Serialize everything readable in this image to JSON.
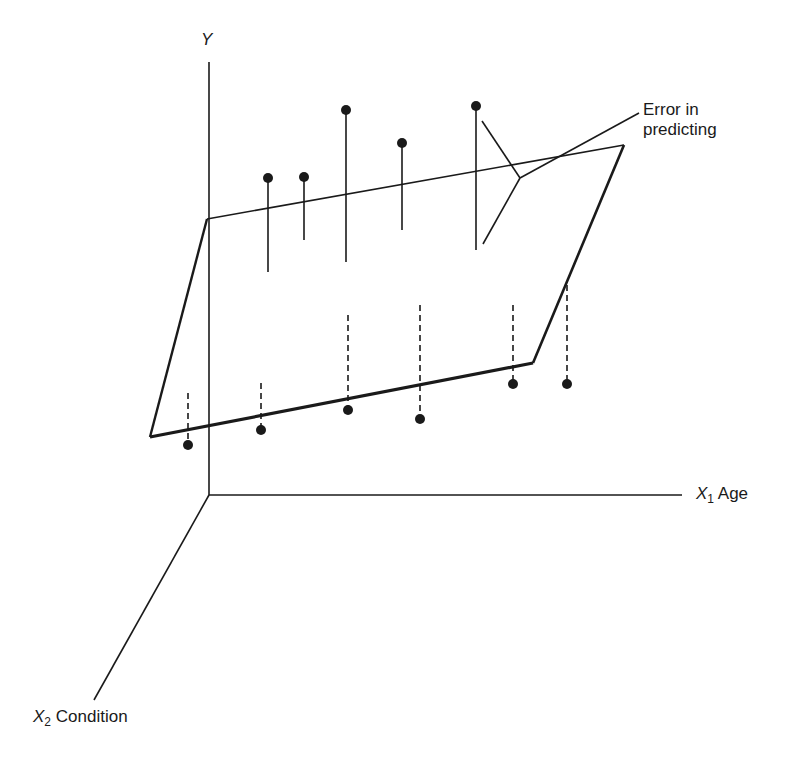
{
  "diagram": {
    "type": "3d-regression-plane",
    "axes": {
      "y": {
        "symbol": "Y"
      },
      "x1": {
        "symbol": "X",
        "subscript": "1",
        "name": "Age"
      },
      "x2": {
        "symbol": "X",
        "subscript": "2",
        "name": "Condition"
      }
    },
    "annotation": {
      "line1": "Error in",
      "line2": "predicting"
    },
    "points_above_plane": [
      {
        "x": 268,
        "y": 178,
        "residual_end_y": 272
      },
      {
        "x": 304,
        "y": 177,
        "residual_end_y": 240
      },
      {
        "x": 346,
        "y": 110,
        "residual_end_y": 262
      },
      {
        "x": 402,
        "y": 143,
        "residual_end_y": 230
      },
      {
        "x": 476,
        "y": 106,
        "residual_end_y": 250
      }
    ],
    "points_below_plane": [
      {
        "x": 188,
        "y": 445,
        "residual_start_y": 393
      },
      {
        "x": 261,
        "y": 430,
        "residual_start_y": 383
      },
      {
        "x": 348,
        "y": 410,
        "residual_start_y": 315
      },
      {
        "x": 420,
        "y": 419,
        "residual_start_y": 305
      },
      {
        "x": 513,
        "y": 384,
        "residual_start_y": 305
      },
      {
        "x": 567,
        "y": 384,
        "residual_start_y": 285
      }
    ],
    "colors": {
      "ink": "#1a1a1a",
      "background": "#ffffff"
    }
  }
}
